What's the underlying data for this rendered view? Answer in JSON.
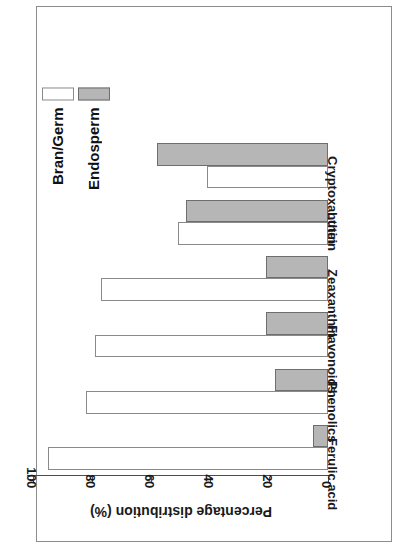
{
  "chart_data": {
    "type": "bar",
    "orientation": "rotated-90",
    "title": "",
    "xlabel": "",
    "ylabel": "Percentage distribution (%)",
    "ylim": [
      0,
      100
    ],
    "yticks": [
      0,
      20,
      40,
      60,
      80,
      100
    ],
    "ytick_labels": [
      "0",
      "20",
      "40",
      "60",
      "80",
      "100"
    ],
    "grid": false,
    "legend_position": "top-left",
    "categories": [
      "Ferulic acid",
      "Phenolics",
      "Flavonoids",
      "Zeaxanthin",
      "Lutein",
      "Cryptoxanthin"
    ],
    "series": [
      {
        "name": "Bran/Germ",
        "color": "#ffffff",
        "edge_color": "#8a8a8a",
        "values": [
          95,
          82,
          79,
          77,
          51,
          41
        ]
      },
      {
        "name": "Endosperm",
        "color": "#b6b6b6",
        "edge_color": "#6e6e6e",
        "values": [
          5,
          18,
          21,
          21,
          48,
          58
        ]
      }
    ]
  },
  "axis": {
    "value_title": "Percentage distribution (%)",
    "ticks": [
      {
        "label": "100",
        "value": 100
      },
      {
        "label": "80",
        "value": 80
      },
      {
        "label": "60",
        "value": 60
      },
      {
        "label": "40",
        "value": 40
      },
      {
        "label": "20",
        "value": 20
      },
      {
        "label": "0",
        "value": 0
      }
    ]
  },
  "legend": {
    "items": [
      {
        "label": "Bran/Germ",
        "series": 0
      },
      {
        "label": "Endosperm",
        "series": 1
      }
    ]
  }
}
